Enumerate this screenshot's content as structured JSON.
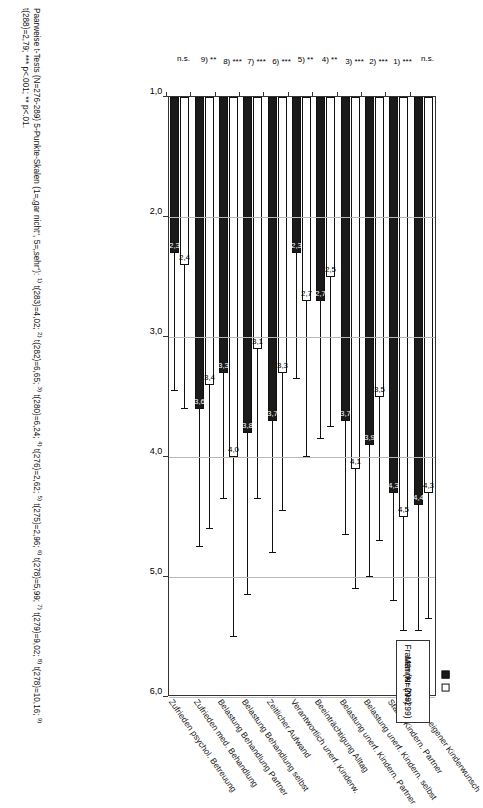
{
  "legend": {
    "items": [
      {
        "key": "maenner",
        "label": "Männer (N=299)",
        "color": "#ffffff"
      },
      {
        "key": "frauen",
        "label": "Frauen (N=299)",
        "color": "#1a1a1a"
      }
    ]
  },
  "axis": {
    "ticks": [
      "1,0",
      "2,0",
      "3,0",
      "4,0",
      "5,0",
      "6,0"
    ],
    "min": 1.0,
    "max": 6.0
  },
  "footnote": {
    "line1": "Paarweise t-Tests (N=276-289) 5-Punkte-Skalen (1=„gar nicht“, 5=„sehr“):",
    "refs": [
      {
        "sup": "1)",
        "text": " t(283)=4,02;"
      },
      {
        "sup": "2)",
        "text": " t(282)=6,65;"
      },
      {
        "sup": "3)",
        "text": " t(280)=6,24;"
      },
      {
        "sup": "4)",
        "text": " t(276)=2,62;"
      },
      {
        "sup": "5)",
        "text": " t(275)=2,96;"
      },
      {
        "sup": "6)",
        "text": " t(278)=5,99;"
      },
      {
        "sup": "7)",
        "text": " t(279)=9,02;"
      },
      {
        "sup": "8)",
        "text": " t(278)=10,16;"
      },
      {
        "sup": "9)",
        "text": " t(288)=2,79;"
      }
    ],
    "plevels": "*** p<.001; ** p<.01."
  },
  "chart_data": {
    "type": "bar",
    "orientation": "horizontal",
    "title": "",
    "xlabel": "",
    "ylabel": "",
    "xlim": [
      1.0,
      6.0
    ],
    "grid": true,
    "legend_position": "top-right",
    "categories": [
      "Starke eigener Kinderwunsch",
      "Starke Kindern. Partner",
      "Belastung unerf. Kindern. selbst",
      "Belastung unerf. Kindern. Partner",
      "Beeinträchtigung Alltag",
      "Verantwortlich unerf. Kinderw.",
      "Zeitlicher Aufwand",
      "Belastung Behandlung selbst",
      "Belastung Behandlung Partner",
      "Zufrieden med. Behandlung",
      "Zufrieden psychol. Betreuung"
    ],
    "categories_used": [
      "Starke eigener Kinderwunsch",
      "Starke Kindern. Partner",
      "Belastung unerf. Kindern. selbst",
      "Belastung unerf. Kindern. Partner",
      "Beeinträchtigung Alltag",
      "Verantwortlich unerf. Kinderw.",
      "Zeitlicher Aufwand",
      "Belastung Behandlung selbst",
      "Belastung Behandlung Partner",
      "Zufrieden med. Behandlung",
      "Zufrieden psychol. Betreuung"
    ],
    "series": [
      {
        "name": "Männer (N=299)",
        "color": "#ffffff",
        "values": [
          4.3,
          4.5,
          3.5,
          4.1,
          2.5,
          2.7,
          3.3,
          3.1,
          4.0,
          3.4,
          2.4
        ],
        "value_labels": [
          "4,3",
          "4,5",
          "3,5",
          "4,1",
          "2,5",
          "2,7",
          "3,3",
          "3,1",
          "4,0",
          "3,4",
          "2,4"
        ],
        "errors": [
          1.05,
          0.95,
          1.2,
          1.0,
          1.25,
          1.3,
          1.15,
          1.25,
          1.5,
          1.2,
          1.2
        ]
      },
      {
        "name": "Frauen (N=299)",
        "color": "#1a1a1a",
        "values": [
          4.4,
          4.3,
          3.9,
          3.7,
          2.7,
          2.3,
          3.7,
          3.8,
          3.3,
          3.6,
          2.3
        ],
        "value_labels": [
          "4,4",
          "4,3",
          "3,9",
          "3,7",
          "2,7",
          "2,3",
          "3,7",
          "3,8",
          "3,3",
          "3,6",
          "2,3"
        ],
        "errors": [
          1.05,
          0.9,
          1.1,
          0.95,
          1.15,
          1.05,
          1.1,
          1.35,
          1.05,
          1.15,
          1.15
        ]
      }
    ],
    "annotations": [
      "n.s.",
      "1) ***",
      "2) ***",
      "3) ***",
      "4) **",
      "5) **",
      "6) ***",
      "7) ***",
      "8) ***",
      "9) **",
      "n.s."
    ]
  }
}
